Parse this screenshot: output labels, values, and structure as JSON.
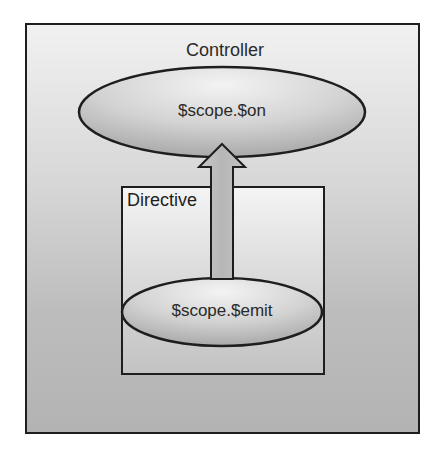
{
  "diagram": {
    "outer_container": {
      "label": "Controller"
    },
    "top_node": {
      "label": "$scope.$on"
    },
    "inner_container": {
      "label": "Directive"
    },
    "bottom_node": {
      "label": "$scope.$emit"
    },
    "edges": [
      {
        "from": "$scope.$emit",
        "to": "$scope.$on",
        "direction": "up",
        "style": "block-arrow"
      }
    ],
    "colors": {
      "stroke": "#1e1e1e",
      "text": "#2a2a2a",
      "fill_light": "#f1f1f1",
      "fill_dark": "#b3b3b3"
    }
  }
}
